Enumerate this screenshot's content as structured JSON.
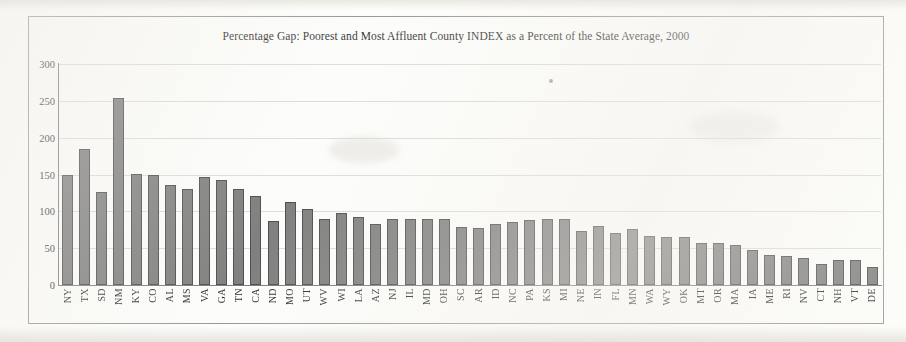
{
  "chart_data": {
    "type": "bar",
    "title": "Percentage Gap: Poorest and Most Affluent County INDEX as a Percent of the State Average, 2000",
    "xlabel": "",
    "ylabel": "",
    "ylim": [
      0,
      300
    ],
    "ytick_step": 50,
    "yticks": [
      300,
      250,
      200,
      150,
      100,
      50,
      0
    ],
    "grid": true,
    "legend": "none",
    "bar_color": "#717171",
    "bar_edge_color": "#3b3b3b",
    "categories": [
      "NY",
      "TX",
      "SD",
      "NM",
      "KY",
      "CO",
      "AL",
      "MS",
      "VA",
      "GA",
      "TN",
      "CA",
      "ND",
      "MO",
      "UT",
      "WV",
      "WI",
      "LA",
      "AZ",
      "NJ",
      "IL",
      "MD",
      "OH",
      "SC",
      "AR",
      "ID",
      "NC",
      "PA",
      "KS",
      "MI",
      "NE",
      "IN",
      "FL",
      "MN",
      "WA",
      "WY",
      "OK",
      "MT",
      "OR",
      "MA",
      "IA",
      "ME",
      "RI",
      "NV",
      "CT",
      "NH",
      "VT",
      "DE"
    ],
    "values": [
      149,
      184,
      126,
      254,
      151,
      150,
      136,
      131,
      146,
      142,
      130,
      121,
      87,
      113,
      103,
      90,
      98,
      93,
      83,
      90,
      90,
      90,
      89,
      79,
      78,
      83,
      86,
      88,
      90,
      90,
      74,
      80,
      70,
      76,
      66,
      65,
      65,
      57,
      57,
      54,
      47,
      41,
      39,
      36,
      28,
      34,
      34,
      24
    ],
    "series": [
      {
        "name": "Percentage Gap",
        "values": [
          149,
          184,
          126,
          254,
          151,
          150,
          136,
          131,
          146,
          142,
          130,
          121,
          87,
          113,
          103,
          90,
          98,
          93,
          83,
          90,
          90,
          90,
          89,
          79,
          78,
          83,
          86,
          88,
          90,
          90,
          74,
          80,
          70,
          76,
          66,
          65,
          65,
          57,
          57,
          54,
          47,
          41,
          39,
          36,
          28,
          34,
          34,
          24
        ]
      }
    ]
  }
}
